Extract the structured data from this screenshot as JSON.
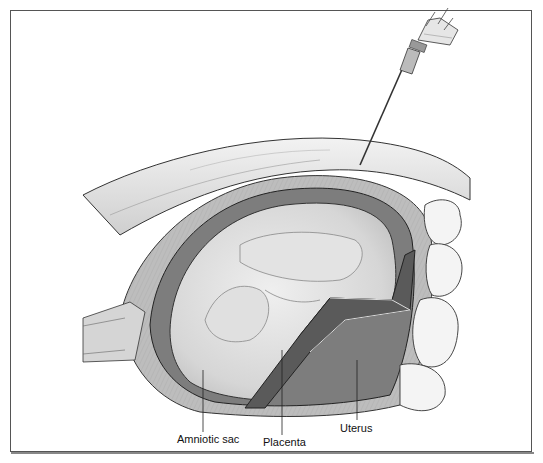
{
  "figure": {
    "labels": [
      {
        "id": "amniotic-sac",
        "text": "Amniotic sac",
        "x": 205,
        "y": 433
      },
      {
        "id": "placenta",
        "text": "Placenta",
        "x": 266,
        "y": 436
      },
      {
        "id": "uterus",
        "text": "Uterus",
        "x": 340,
        "y": 422
      }
    ],
    "colors": {
      "ink": "#111111",
      "frame": "#555555",
      "uterus_wall": "#8a8a8a",
      "placenta": "#5e5e5e",
      "amniotic_fluid": "#d8d8d8",
      "abdominal_wall": "#e6e6e6",
      "background": "#ffffff"
    }
  }
}
